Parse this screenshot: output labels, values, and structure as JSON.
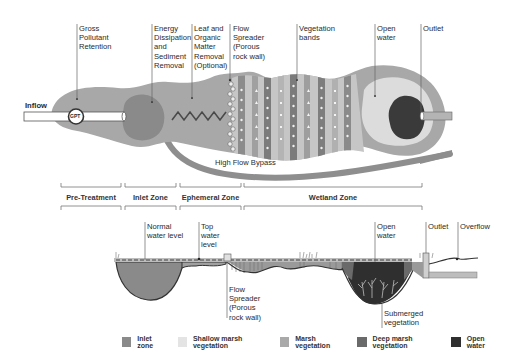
{
  "plan_view": {
    "labels": {
      "gross_pollutant": "Gross\nPollutant\nRetention",
      "energy_dissipation": "Energy\nDissipation\nand\nSediment\nRemoval",
      "leaf_organic": "Leaf and\nOrganic\nMatter\nRemoval\n(Optional)",
      "flow_spreader": "Flow\nSpreader\n(Porous\nrock wall)",
      "vegetation_bands": "Vegetation\nbands",
      "open_water": "Open\nwater",
      "outlet": "Outlet",
      "inflow": "Inflow",
      "gpt": "GPT",
      "high_flow_bypass": "High Flow Bypass"
    }
  },
  "zones": [
    {
      "label": "Pre-Treatment"
    },
    {
      "label": "Inlet Zone"
    },
    {
      "label": "Ephemeral Zone"
    },
    {
      "label": "Wetland Zone"
    }
  ],
  "section_view": {
    "labels": {
      "normal_water_level": "Normal\nwater level",
      "top_water_level": "Top\nwater\nlevel",
      "flow_spreader": "Flow\nSpreader\n(Porous\nrock wall)",
      "open_water": "Open\nwater",
      "outlet": "Outlet",
      "overflow": "Overflow",
      "submerged_vegetation": "Submerged\nvegetation"
    }
  },
  "legend": [
    {
      "label": "Inlet zone",
      "color": "#8a8a8a"
    },
    {
      "label": "Shallow marsh vegetation",
      "color": "#e4e4e4"
    },
    {
      "label": "Marsh vegetation",
      "color": "#a9a9a9"
    },
    {
      "label": "Deep marsh vegetation",
      "color": "#6a6a6a"
    },
    {
      "label": "Open water",
      "color": "#2f2f2f"
    }
  ],
  "colors": {
    "outer": "#a8a8a8",
    "inlet": "#8a8a8a",
    "light": "#dcdcdc",
    "band_dark": "#7b7b7b",
    "open_water": "#3a3a3a",
    "bypass": "#8e8e8e"
  }
}
